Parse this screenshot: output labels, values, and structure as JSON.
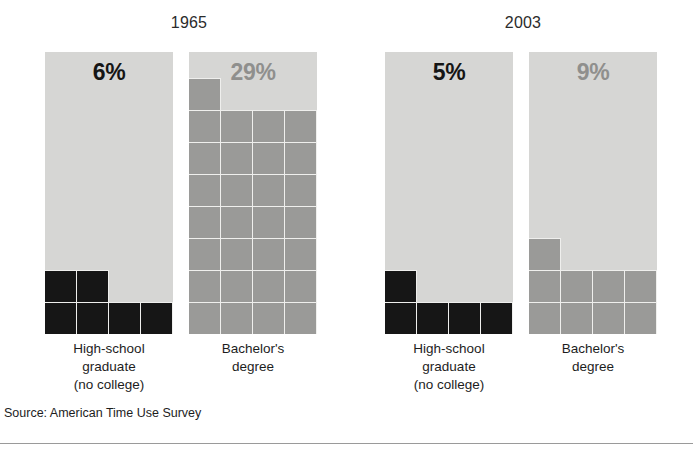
{
  "chart_data": {
    "type": "bar",
    "title": "",
    "subtitle": "",
    "xlabel": "",
    "ylabel": "",
    "notation": "Each panel is a 4-column unit grid; one filled square = 1 percent, filled from the bottom-left.",
    "units_per_row": 4,
    "grid_rows": 9,
    "source": "Source: American Time Use Survey",
    "groups": [
      {
        "name": "1965",
        "categories": [
          "High-school\ngraduate\n(no college)",
          "Bachelor's\ndegree"
        ],
        "values": [
          6,
          29
        ],
        "value_labels": [
          "6%",
          "29%"
        ],
        "colors": [
          "#161616",
          "#9a9a98"
        ]
      },
      {
        "name": "2003",
        "categories": [
          "High-school\ngraduate\n(no college)",
          "Bachelor's\ndegree"
        ],
        "values": [
          5,
          9
        ],
        "value_labels": [
          "5%",
          "9%"
        ],
        "colors": [
          "#161616",
          "#9a9a98"
        ]
      }
    ],
    "series": [
      {
        "name": "High-school graduate (no college)",
        "categories": [
          "1965",
          "2003"
        ],
        "values": [
          6,
          5
        ]
      },
      {
        "name": "Bachelor's degree",
        "categories": [
          "1965",
          "2003"
        ],
        "values": [
          29,
          9
        ]
      }
    ],
    "legend": "none",
    "grid": false
  },
  "years": [
    {
      "label": "1965"
    },
    {
      "label": "2003"
    }
  ],
  "panels": [
    {
      "value_label": "6%",
      "value": 6,
      "tone": "dark",
      "caption": "High-school\ngraduate\n(no college)"
    },
    {
      "value_label": "29%",
      "value": 29,
      "tone": "mid",
      "caption": "Bachelor's\ndegree"
    },
    {
      "value_label": "5%",
      "value": 5,
      "tone": "dark",
      "caption": "High-school\ngraduate\n(no college)"
    },
    {
      "value_label": "9%",
      "value": 9,
      "tone": "mid",
      "caption": "Bachelor's\ndegree"
    }
  ],
  "footer": {
    "source": "Source: American Time Use Survey"
  },
  "colors": {
    "panel_background": "#d6d6d4",
    "dark_fill": "#161616",
    "mid_fill": "#9a9a98",
    "gridline": "#efefed",
    "text": "#1d1d1d",
    "rule": "#9a9a9a"
  }
}
